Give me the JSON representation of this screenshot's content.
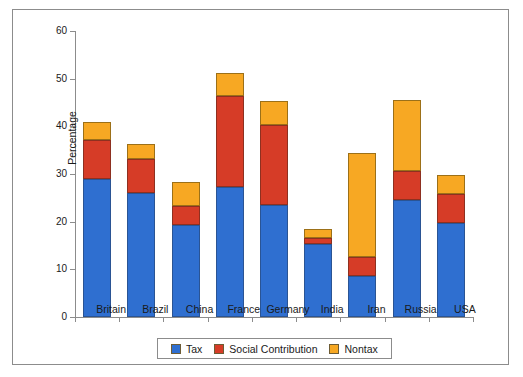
{
  "figure": {
    "border_color": "#8c8c8c",
    "background": "#ffffff"
  },
  "chart_data": {
    "type": "bar",
    "title": "",
    "subtitle": "",
    "stacked": true,
    "xlabel": "",
    "ylabel": "Percentage",
    "ylim": [
      0,
      60
    ],
    "yticks": [
      0,
      10,
      20,
      30,
      40,
      50,
      60
    ],
    "ytick_labels": [
      "0",
      "10",
      "20",
      "30",
      "40",
      "50",
      "60"
    ],
    "grid": false,
    "legend_position": "bottom",
    "categories": [
      "Britain",
      "Brazil",
      "China",
      "France",
      "Germany",
      "India",
      "Iran",
      "Russia",
      "USA"
    ],
    "series": [
      {
        "name": "Tax",
        "color": "#2f6fd0",
        "values": [
          29.0,
          26.1,
          19.2,
          27.3,
          23.4,
          15.4,
          8.5,
          24.6,
          19.7
        ]
      },
      {
        "name": "Social Contribution",
        "color": "#d63c27",
        "values": [
          8.1,
          7.1,
          4.0,
          19.0,
          16.9,
          1.1,
          4.0,
          6.0,
          6.1
        ]
      },
      {
        "name": "Nontax",
        "color": "#f7a823",
        "values": [
          3.9,
          3.0,
          5.1,
          4.9,
          5.0,
          2.0,
          22.0,
          15.0,
          3.9
        ]
      }
    ],
    "totals": [
      41.0,
      36.2,
      28.3,
      51.2,
      45.3,
      18.5,
      34.5,
      45.6,
      29.7
    ]
  },
  "legend": {
    "items": [
      {
        "label": "Tax",
        "color": "#2f6fd0"
      },
      {
        "label": "Social Contribution",
        "color": "#d63c27"
      },
      {
        "label": "Nontax",
        "color": "#f7a823"
      }
    ]
  }
}
